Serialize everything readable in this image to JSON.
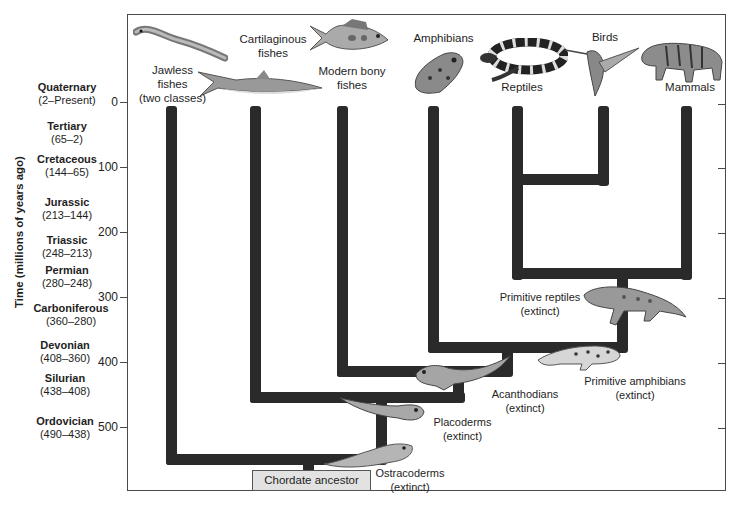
{
  "diagram": {
    "type": "phylogenetic-tree",
    "y_axis": {
      "title": "Time (millions of years ago)",
      "ticks": [
        "0",
        "100",
        "200",
        "300",
        "400",
        "500"
      ]
    },
    "periods": [
      {
        "name": "Quaternary",
        "range": "(2–Present)"
      },
      {
        "name": "Tertiary",
        "range": "(65–2)"
      },
      {
        "name": "Cretaceous",
        "range": "(144–65)"
      },
      {
        "name": "Jurassic",
        "range": "(213–144)"
      },
      {
        "name": "Triassic",
        "range": "(248–213)"
      },
      {
        "name": "Permian",
        "range": "(280–248)"
      },
      {
        "name": "Carboniferous",
        "range": "(360–280)"
      },
      {
        "name": "Devonian",
        "range": "(408–360)"
      },
      {
        "name": "Silurian",
        "range": "(438–408)"
      },
      {
        "name": "Ordovician",
        "range": "(490–438)"
      }
    ],
    "living_groups": [
      {
        "label_line1": "Jawless",
        "label_line2": "fishes",
        "label_line3": "(two classes)"
      },
      {
        "label_line1": "Cartilaginous",
        "label_line2": "fishes"
      },
      {
        "label_line1": "Modern bony",
        "label_line2": "fishes"
      },
      {
        "label_line1": "Amphibians"
      },
      {
        "label_line1": "Reptiles"
      },
      {
        "label_line1": "Birds"
      },
      {
        "label_line1": "Mammals"
      }
    ],
    "extinct_groups": [
      {
        "name": "Primitive reptiles",
        "status": "(extinct)"
      },
      {
        "name": "Primitive amphibians",
        "status": "(extinct)"
      },
      {
        "name": "Acanthodians",
        "status": "(extinct)"
      },
      {
        "name": "Placoderms",
        "status": "(extinct)"
      },
      {
        "name": "Ostracoderms",
        "status": "(extinct)"
      }
    ],
    "root": {
      "label": "Chordate ancestor"
    },
    "colors": {
      "branch": "#2a2a2a",
      "frame": "#4a4a4a",
      "root_box": "#e2e2e2"
    }
  }
}
